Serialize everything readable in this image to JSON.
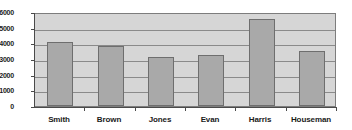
{
  "chart_data": {
    "type": "bar",
    "title": "",
    "subtitle": "",
    "xlabel": "",
    "ylabel": "",
    "categories": [
      "Smith",
      "Brown",
      "Jones",
      "Evan",
      "Harris",
      "Houseman"
    ],
    "values": [
      4100,
      3800,
      3150,
      3250,
      5550,
      3500
    ],
    "series": [
      {
        "name": "",
        "values": [
          4100,
          3800,
          3150,
          3250,
          5550,
          3500
        ]
      }
    ],
    "ylim": [
      0,
      6000
    ],
    "ytick_values": [
      0,
      1000,
      2000,
      3000,
      4000,
      5000,
      6000
    ],
    "ytick_labels": [
      "0",
      "1000",
      "2000",
      "3000",
      "4000",
      "5000",
      "6000"
    ],
    "grid": true,
    "grid_axis": "y",
    "legend": false,
    "legend_position": "none",
    "annotations": []
  },
  "style": {
    "plot_background": "#d6d6d6",
    "bar_fill": "#a9a9a9",
    "bar_stroke": "#6e6e6e",
    "gridline_color": "#8a8a8a",
    "axis_color": "#4a4a4a",
    "text_color": "#1a1a1a",
    "page_background": "#ffffff"
  }
}
